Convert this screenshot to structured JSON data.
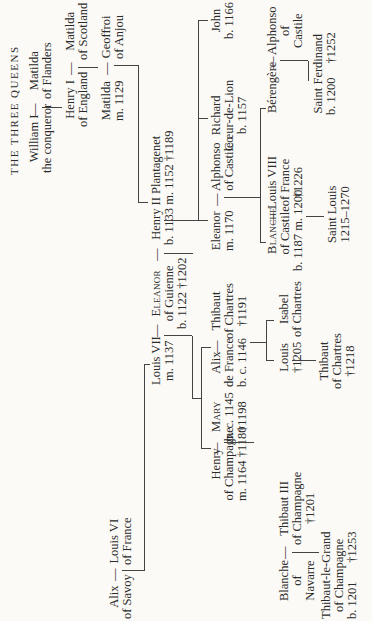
{
  "title": "THE THREE QUEENS",
  "people": {
    "william": {
      "name": "William I",
      "sub": "the conqueror"
    },
    "matilda_flanders": {
      "name": "Matilda",
      "sub": "of Flanders"
    },
    "henry1": {
      "name": "Henry I",
      "sub": "of England"
    },
    "matilda_scotland": {
      "name": "Matilda",
      "sub": "of Scotland"
    },
    "matilda": {
      "name": "Matilda",
      "sub": "m. 1129"
    },
    "geoffroi": {
      "name": "Geoffroi",
      "sub": "of Anjou"
    },
    "henry2": {
      "name": "Henry II Plantagenet",
      "sub": "b. 1133 m. 1152 †1189"
    },
    "eleanor_guienne": {
      "name": "Eleanor",
      "sub": "of Guienne",
      "sub2": "b. 1122 †1202"
    },
    "louis7": {
      "name": "Louis VII",
      "sub": "m. 1137"
    },
    "alix_savoy": {
      "name": "Alix",
      "sub": "of Savoy"
    },
    "louis6": {
      "name": "Louis VI",
      "sub": "of France"
    },
    "henry_champagne": {
      "name": "Henry",
      "sub": "of Champagne",
      "sub2": "m. 1164 †1180"
    },
    "mary": {
      "name": "Mary",
      "sub": "b. c. 1145",
      "sub2": "†1198"
    },
    "alix_france": {
      "name": "Alix",
      "sub": "de France",
      "sub2": "b. c. 1146"
    },
    "thibaut_chartres": {
      "name": "Thibaut",
      "sub": "of Chartres",
      "sub2": "†1191"
    },
    "eleanor_1170": {
      "name": "Eleanor",
      "sub": "m. 1170"
    },
    "alphonso_castile": {
      "name": "Alphonso",
      "sub": "of Castile"
    },
    "richard": {
      "name": "Richard",
      "sub": "Cœur-de-Lion",
      "sub2": "b. 1157"
    },
    "john": {
      "name": "John",
      "sub": "b. 1166"
    },
    "blanche_navarre": {
      "name": "Blanche",
      "sub": "of",
      "sub2": "Navarre"
    },
    "thibaut3": {
      "name": "Thibaut III",
      "sub": "of Champagne",
      "sub2": "†1201"
    },
    "louis_chartres": {
      "name": "Louis",
      "sub": "†1205"
    },
    "isabel_chartres": {
      "name": "Isabel",
      "sub": "of Chartres"
    },
    "blanche_castile": {
      "name": "Blanche",
      "sub": "of Castile",
      "sub2": "b. 1187 m. 1200"
    },
    "louis8": {
      "name": "Louis VIII",
      "sub": "of France",
      "sub2": "†1226"
    },
    "berengere": {
      "name": "Bérengère"
    },
    "alphonso_of_castile": {
      "name": "Alphonso",
      "sub": "of",
      "sub2": "Castile"
    },
    "thibaut_grand": {
      "name": "Thibaut-le-Grand",
      "sub": "of Champagne",
      "sub2": "b. 1201",
      "sub3": "†1253"
    },
    "thibaut_chartres2": {
      "name": "Thibaut",
      "sub": "of Chartres",
      "sub2": "†1218"
    },
    "saint_louis": {
      "name": "Saint Louis",
      "sub": "1215–1270"
    },
    "saint_ferdinand": {
      "name": "Saint Ferdinand",
      "sub": "b. 1200",
      "sub2": "†1252"
    }
  },
  "marriage_dash": "—"
}
